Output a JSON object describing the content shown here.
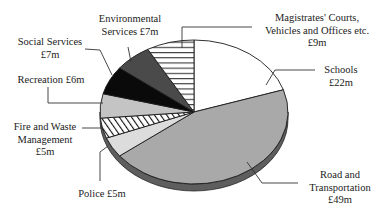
{
  "chart_data": {
    "type": "pie",
    "title": "",
    "style": "3D tilted pie, monochrome fills and hatching",
    "unit": "£m",
    "start_angle_deg": -90,
    "direction": "clockwise",
    "slices": [
      {
        "label": "Schools",
        "value": 22,
        "display": "£22m",
        "fill": "#ffffff",
        "pattern": "none"
      },
      {
        "label": "Road and Transportation",
        "value": 49,
        "display": "£49m",
        "fill": "#a9a9a9",
        "pattern": "none"
      },
      {
        "label": "Police",
        "value": 5,
        "display": "£5m",
        "fill": "#dcdcdc",
        "pattern": "none"
      },
      {
        "label": "Fire and Waste Management",
        "value": 5,
        "display": "£5m",
        "fill": "#ffffff",
        "pattern": "diagonal"
      },
      {
        "label": "Recreation",
        "value": 6,
        "display": "£6m",
        "fill": "#c4c4c4",
        "pattern": "none"
      },
      {
        "label": "Social Services",
        "value": 7,
        "display": "£7m",
        "fill": "#0a0a0a",
        "pattern": "none"
      },
      {
        "label": "Environmental Services",
        "value": 7,
        "display": "£7m",
        "fill": "#4a4a4a",
        "pattern": "none"
      },
      {
        "label": "Magistrates' Courts, Vehicles and Offices etc.",
        "value": 9,
        "display": "£9m",
        "fill": "#ffffff",
        "pattern": "horizontal"
      }
    ],
    "total": 110
  },
  "labels": {
    "magistrates": {
      "l1": "Magistrates' Courts,",
      "l2": "Vehicles and Offices etc.",
      "l3": "£9m"
    },
    "schools": {
      "l1": "Schools",
      "l2": "£22m"
    },
    "environmental": {
      "l1": "Environmental",
      "l2": "Services £7m"
    },
    "social": {
      "l1": "Social Services",
      "l2": "£7m"
    },
    "recreation": {
      "l1": "Recreation £6m"
    },
    "fire": {
      "l1": "Fire and Waste",
      "l2": "Management",
      "l3": "£5m"
    },
    "police": {
      "l1": "Police £5m"
    },
    "road": {
      "l1": "Road and",
      "l2": "Transportation",
      "l3": "£49m"
    }
  }
}
